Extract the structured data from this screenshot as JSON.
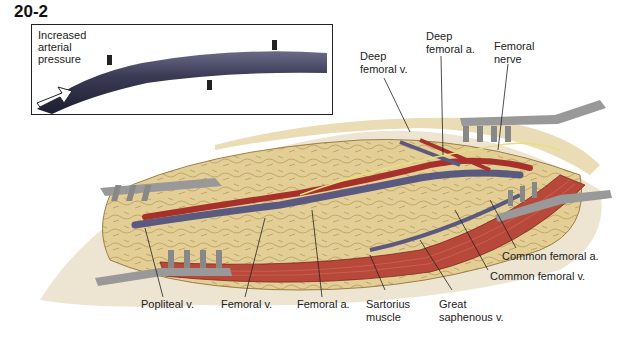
{
  "figure_number": "20-2",
  "inset": {
    "label_lines": [
      "Increased",
      "arterial",
      "pressure"
    ]
  },
  "labels": {
    "deep_femoral_v": [
      "Deep",
      "femoral v."
    ],
    "deep_femoral_a": [
      "Deep",
      "femoral a."
    ],
    "femoral_nerve": [
      "Femoral",
      "nerve"
    ],
    "common_femoral_a": "Common femoral a.",
    "common_femoral_v": "Common femoral v.",
    "popliteal_v": "Popliteal v.",
    "femoral_v": "Femoral v.",
    "femoral_a": "Femoral a.",
    "sartorius": [
      "Sartorius",
      "muscle"
    ],
    "great_saphenous": [
      "Great",
      "saphenous v."
    ]
  },
  "colors": {
    "fat": "#e6d39a",
    "artery": "#a8302a",
    "vein": "#5a5a80",
    "muscle": "#b8483a",
    "retractor": "#8a8a8a",
    "vessel_inset": "#3a3a55"
  }
}
